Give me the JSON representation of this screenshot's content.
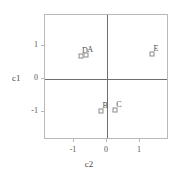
{
  "chart_data": {
    "type": "scatter",
    "title": "",
    "xlabel": "c2",
    "ylabel": "c1",
    "xlim": [
      -1.88,
      1.88
    ],
    "ylim": [
      -1.85,
      1.94
    ],
    "xticks": [
      -1,
      0,
      1
    ],
    "xticklabels": [
      "-1",
      "0",
      "1"
    ],
    "yticks": [
      -1,
      0,
      1
    ],
    "yticklabels": [
      "-1",
      "0",
      "1"
    ],
    "grid": false,
    "legend": "none",
    "zero_lines": true,
    "marker": "open-square",
    "points": [
      {
        "label": "D",
        "x": -0.79,
        "y": 0.7
      },
      {
        "label": "A",
        "x": -0.63,
        "y": 0.73
      },
      {
        "label": "E",
        "x": 1.36,
        "y": 0.76
      },
      {
        "label": "B",
        "x": -0.18,
        "y": -0.97
      },
      {
        "label": "C",
        "x": 0.24,
        "y": -0.95
      }
    ]
  },
  "style": {
    "background": "#ffffff",
    "frame_color": "#b9b9b9",
    "axis_color": "#6e6e6e",
    "marker_edge": "#8a8a8a",
    "marker_face": "#ffffff",
    "text_color": "#4a4a4a"
  }
}
